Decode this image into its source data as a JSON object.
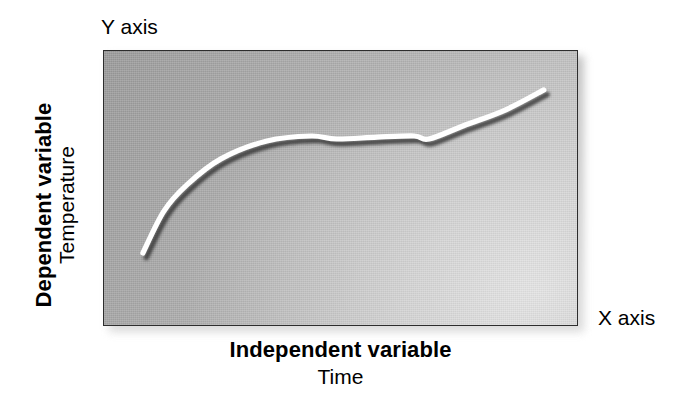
{
  "figure": {
    "title_present": false,
    "y_axis_tag": "Y axis",
    "x_axis_tag": "X axis",
    "y_axis_bold_label": "Dependent variable",
    "y_axis_plain_label": "Temperature",
    "x_axis_bold_label": "Independent variable",
    "x_axis_plain_label": "Time"
  },
  "colors": {
    "panel_dark": "#9a9a9a",
    "panel_light": "#c4c4c4",
    "panel_border": "#2d2d2d",
    "curve_highlight": "#ffffff",
    "curve_shadow": "#2a2a2a",
    "text": "#000000",
    "page_background": "#ffffff"
  },
  "chart_data": {
    "type": "line",
    "title": "",
    "xlabel": "Independent variable / Time",
    "ylabel": "Dependent variable / Temperature",
    "grid": false,
    "legend": "none",
    "axis_ticks": "none",
    "xlim": [
      0,
      100
    ],
    "ylim": [
      0,
      100
    ],
    "series": [
      {
        "name": "Temperature over time",
        "style": "smooth-white-line-with-drop-shadow",
        "x": [
          8.2,
          12.6,
          17.5,
          24.6,
          34.3,
          43.6,
          49.0,
          57.5,
          65.3,
          68.4,
          75.8,
          84.2,
          92.6
        ],
        "y": [
          26.8,
          42.0,
          51.6,
          60.9,
          67.4,
          69.2,
          68.1,
          68.8,
          69.2,
          68.1,
          73.0,
          78.4,
          85.9
        ]
      }
    ]
  }
}
